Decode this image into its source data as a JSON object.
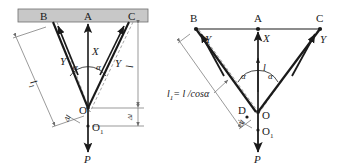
{
  "figure": {
    "background_color": "#ffffff",
    "stroke_color": "#1a1a1a",
    "support_bar_color": "#c8c8c8",
    "support_bar_border_color": "#6e6e6e",
    "dashed_color": "#8a8a8a",
    "dimension_color": "#6e6e6e"
  },
  "left_diagram": {
    "name": "left-panel",
    "points": {
      "B": "B",
      "A": "A",
      "C": "C",
      "O": "O",
      "O1": "O",
      "O1_sub": "1",
      "P": "P"
    },
    "forces": {
      "x_label": "X",
      "y_left_label": "Y",
      "y_right_label": "Y",
      "p_label": "P"
    },
    "angles": {
      "left": "α",
      "right": "α"
    },
    "lengths": {
      "l1_label": "l",
      "l1_sub": "1",
      "l_label": "l",
      "delta_l_label": "Δl"
    }
  },
  "right_diagram": {
    "name": "right-panel",
    "points": {
      "B": "B",
      "A": "A",
      "C": "C",
      "D": "D",
      "O": "O",
      "O1": "O",
      "O1_sub": "1",
      "P": "P"
    },
    "forces": {
      "x_label": "X",
      "y_left_label": "Y",
      "y_right_label": "Y",
      "p_label": "P"
    },
    "angles": {
      "left": "α",
      "right": "α"
    },
    "lengths": {
      "l_label": "l",
      "delta_l_label": "Δl"
    },
    "equation": {
      "lhs": "l",
      "lhs_sub": "1",
      "rhs": "= l /cosα"
    }
  }
}
